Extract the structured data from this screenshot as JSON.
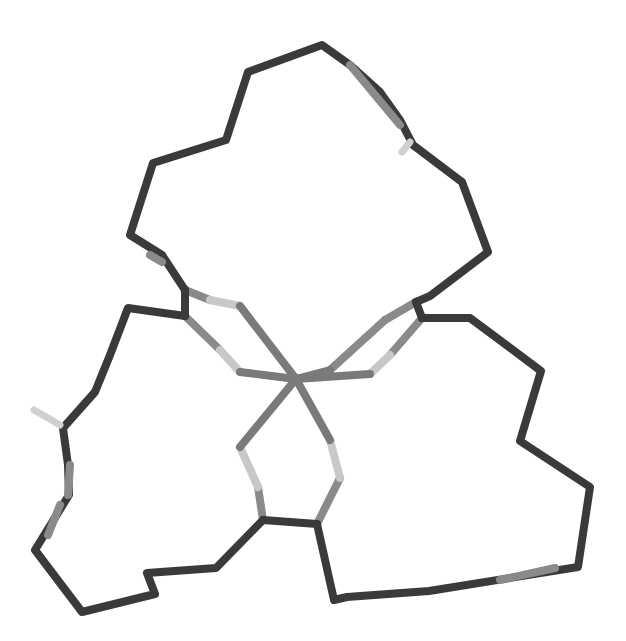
{
  "figure": {
    "type": "molecular-stick-model",
    "background": "#ffffff",
    "bond_width": 8,
    "colors": {
      "carbon": "#3a3a3a",
      "nitrogen": "#8a8a8a",
      "sulfur": "#c8c8c8",
      "metal": "#7a7a7a",
      "oxygen": "#d0d0d0"
    },
    "metal_center": {
      "x": 296,
      "y": 379
    },
    "ring_top": {
      "path": [
        [
          185,
          290
        ],
        [
          162,
          255
        ],
        [
          130,
          235
        ],
        [
          153,
          163
        ],
        [
          226,
          140
        ],
        [
          248,
          72
        ],
        [
          322,
          45
        ],
        [
          350,
          65
        ],
        [
          380,
          92
        ],
        [
          400,
          120
        ],
        [
          413,
          145
        ],
        [
          462,
          182
        ],
        [
          488,
          252
        ],
        [
          430,
          296
        ],
        [
          416,
          302
        ]
      ],
      "nitrogen_segments": [
        [
          [
            150,
            255
          ],
          [
            162,
            262
          ]
        ],
        [
          [
            350,
            65
          ],
          [
            400,
            125
          ]
        ]
      ],
      "pendant": [
        [
          410,
          142
        ],
        [
          402,
          152
        ]
      ]
    },
    "ring_left": {
      "path": [
        [
          185,
          316
        ],
        [
          128,
          308
        ],
        [
          110,
          355
        ],
        [
          95,
          392
        ],
        [
          63,
          428
        ],
        [
          68,
          465
        ],
        [
          69,
          495
        ],
        [
          35,
          550
        ],
        [
          82,
          612
        ],
        [
          155,
          594
        ],
        [
          147,
          573
        ],
        [
          216,
          568
        ],
        [
          263,
          520
        ]
      ],
      "nitrogen_segments": [
        [
          [
            70,
            465
          ],
          [
            68,
            495
          ]
        ],
        [
          [
            60,
            505
          ],
          [
            48,
            535
          ]
        ]
      ],
      "pendant": [
        [
          60,
          425
        ],
        [
          34,
          410
        ]
      ]
    },
    "ring_right": {
      "path": [
        [
          422,
          318
        ],
        [
          470,
          318
        ],
        [
          541,
          371
        ],
        [
          520,
          441
        ],
        [
          590,
          487
        ],
        [
          578,
          567
        ],
        [
          429,
          591
        ],
        [
          347,
          597
        ],
        [
          334,
          600
        ],
        [
          317,
          524
        ]
      ],
      "nitrogen_segments": [
        [
          [
            555,
            568
          ],
          [
            500,
            580
          ]
        ]
      ],
      "pendant": null
    },
    "chelate_arms": [
      {
        "from": [
          185,
          290
        ],
        "via": [
          [
            210,
            300
          ],
          [
            240,
            306
          ]
        ],
        "to": [
          296,
          379
        ],
        "shade": "light"
      },
      {
        "from": [
          185,
          316
        ],
        "via": [
          [
            220,
            350
          ],
          [
            240,
            372
          ]
        ],
        "to": [
          296,
          379
        ],
        "shade": "light"
      },
      {
        "from": [
          416,
          302
        ],
        "via": [
          [
            385,
            320
          ],
          [
            330,
            370
          ]
        ],
        "to": [
          296,
          379
        ],
        "shade": "mid"
      },
      {
        "from": [
          422,
          318
        ],
        "via": [
          [
            390,
            355
          ],
          [
            370,
            374
          ]
        ],
        "to": [
          296,
          379
        ],
        "shade": "light"
      },
      {
        "from": [
          263,
          520
        ],
        "via": [
          [
            258,
            487
          ],
          [
            240,
            447
          ]
        ],
        "to": [
          296,
          379
        ],
        "shade": "light"
      },
      {
        "from": [
          317,
          524
        ],
        "via": [
          [
            340,
            478
          ],
          [
            330,
            440
          ]
        ],
        "to": [
          296,
          379
        ],
        "shade": "light"
      }
    ],
    "backbone_links": [
      {
        "from": [
          263,
          520
        ],
        "to": [
          317,
          524
        ]
      },
      {
        "from": [
          185,
          290
        ],
        "to": [
          185,
          316
        ]
      },
      {
        "from": [
          416,
          302
        ],
        "to": [
          422,
          318
        ]
      }
    ]
  }
}
